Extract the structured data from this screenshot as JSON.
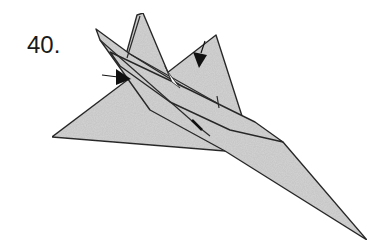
{
  "diagram": {
    "step_number": "40.",
    "colors": {
      "paper_fill": "#d4d4d4",
      "outline": "#2a2a2a",
      "arrow": "#111111",
      "background": "#ffffff"
    },
    "arrows": [
      {
        "name": "left-push-arrow",
        "direction": "right"
      },
      {
        "name": "right-push-arrow",
        "direction": "down-left"
      }
    ]
  }
}
